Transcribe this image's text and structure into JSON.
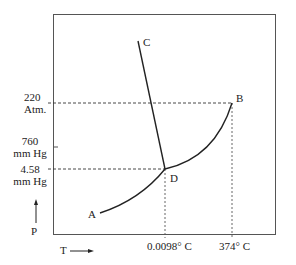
{
  "diagram": {
    "points": {
      "A": "A",
      "B": "B",
      "C": "C",
      "D": "D"
    },
    "y_labels": {
      "critical_pressure": [
        "220",
        "Atm."
      ],
      "normal_pressure": [
        "760",
        "mm Hg"
      ],
      "triple_pressure": [
        "4.58",
        "mm Hg"
      ]
    },
    "x_labels": {
      "triple_temp": "0.0098° C",
      "critical_temp": "374° C"
    },
    "axis": {
      "y": "P",
      "x": "T"
    },
    "colors": {
      "line": "#222222",
      "frame": "#555555"
    }
  }
}
